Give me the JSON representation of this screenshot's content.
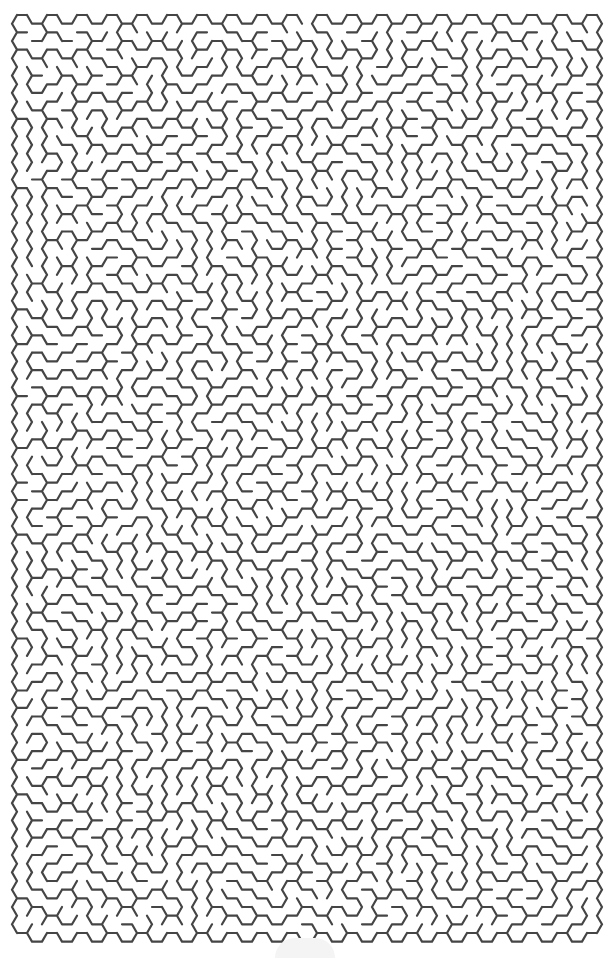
{
  "puzzle": {
    "type": "hexagonal-maze",
    "grid": {
      "columns": 39,
      "rows": 53,
      "hex_side_px": 10,
      "origin_x": 12,
      "origin_y": 15,
      "seed": 20240611
    },
    "colors": {
      "wall": "#454545",
      "background": "#ffffff"
    },
    "entrance": {
      "side": "top",
      "column": 19
    },
    "exit": {
      "side": "bottom",
      "column": 19
    }
  }
}
